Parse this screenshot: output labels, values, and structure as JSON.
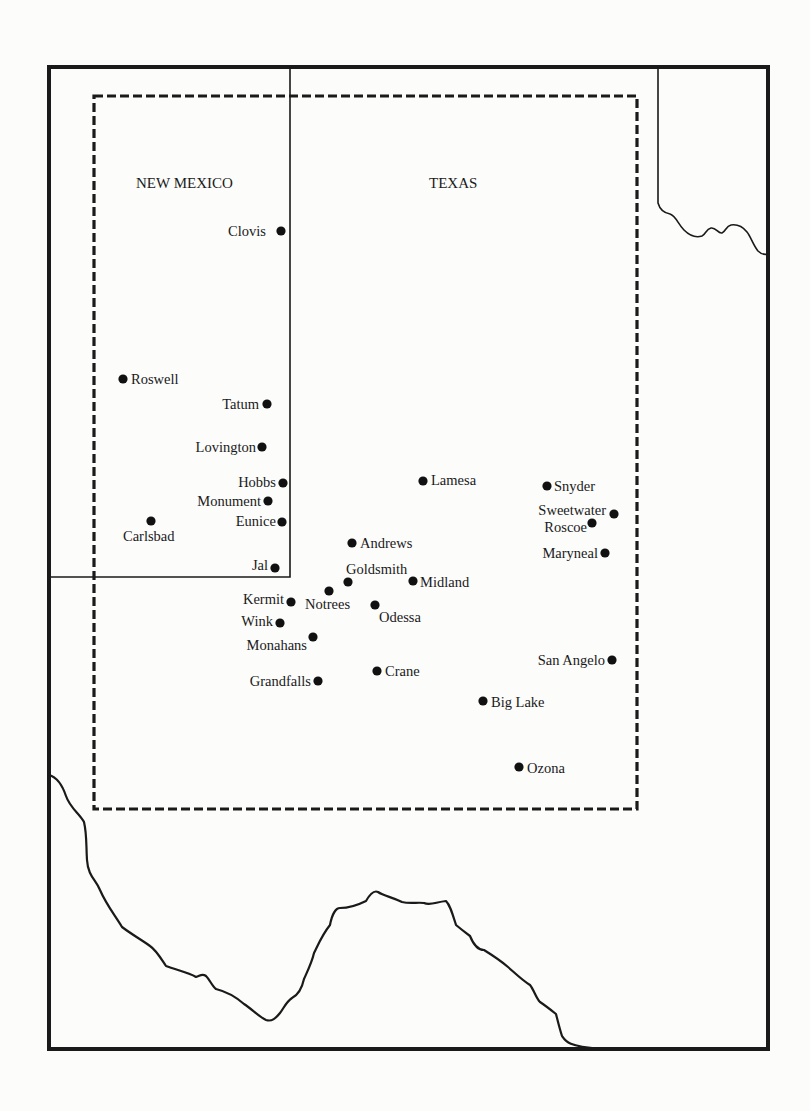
{
  "map": {
    "state_labels": [
      {
        "name": "new-mexico",
        "text": "NEW MEXICO",
        "x": 136,
        "y": 188
      },
      {
        "name": "texas",
        "text": "TEXAS",
        "x": 429,
        "y": 188
      }
    ],
    "cities": [
      {
        "name": "Clovis",
        "dot": [
          281,
          231
        ],
        "label": [
          228,
          236
        ],
        "anchor": "start"
      },
      {
        "name": "Roswell",
        "dot": [
          123,
          379
        ],
        "label": [
          131,
          384
        ],
        "anchor": "start"
      },
      {
        "name": "Tatum",
        "dot": [
          267,
          404
        ],
        "label": [
          259,
          409
        ],
        "anchor": "end"
      },
      {
        "name": "Lovington",
        "dot": [
          262,
          447
        ],
        "label": [
          256,
          452
        ],
        "anchor": "end"
      },
      {
        "name": "Hobbs",
        "dot": [
          283,
          483
        ],
        "label": [
          276,
          487
        ],
        "anchor": "end"
      },
      {
        "name": "Monument",
        "dot": [
          268,
          501
        ],
        "label": [
          261,
          506
        ],
        "anchor": "end"
      },
      {
        "name": "Eunice",
        "dot": [
          282,
          522
        ],
        "label": [
          276,
          526
        ],
        "anchor": "end"
      },
      {
        "name": "Carlsbad",
        "dot": [
          151,
          521
        ],
        "label": [
          123,
          541
        ],
        "anchor": "start"
      },
      {
        "name": "Jal",
        "dot": [
          275,
          568
        ],
        "label": [
          268,
          570
        ],
        "anchor": "end"
      },
      {
        "name": "Andrews",
        "dot": [
          352,
          543
        ],
        "label": [
          360,
          548
        ],
        "anchor": "start"
      },
      {
        "name": "Goldsmith",
        "dot": [
          348,
          582
        ],
        "label": [
          346,
          574
        ],
        "anchor": "start"
      },
      {
        "name": "Notrees",
        "dot": [
          329,
          591
        ],
        "label": [
          305,
          609
        ],
        "anchor": "start"
      },
      {
        "name": "Midland",
        "dot": [
          413,
          581
        ],
        "label": [
          420,
          587
        ],
        "anchor": "start"
      },
      {
        "name": "Kermit",
        "dot": [
          291,
          602
        ],
        "label": [
          284,
          604
        ],
        "anchor": "end"
      },
      {
        "name": "Odessa",
        "dot": [
          375,
          605
        ],
        "label": [
          379,
          622
        ],
        "anchor": "start"
      },
      {
        "name": "Wink",
        "dot": [
          280,
          623
        ],
        "label": [
          273,
          626
        ],
        "anchor": "end"
      },
      {
        "name": "Monahans",
        "dot": [
          313,
          637
        ],
        "label": [
          307,
          650
        ],
        "anchor": "end"
      },
      {
        "name": "Grandfalls",
        "dot": [
          318,
          681
        ],
        "label": [
          311,
          686
        ],
        "anchor": "end"
      },
      {
        "name": "Crane",
        "dot": [
          377,
          671
        ],
        "label": [
          385,
          676
        ],
        "anchor": "start"
      },
      {
        "name": "Lamesa",
        "dot": [
          423,
          481
        ],
        "label": [
          431,
          485
        ],
        "anchor": "start"
      },
      {
        "name": "Snyder",
        "dot": [
          547,
          486
        ],
        "label": [
          554,
          491
        ],
        "anchor": "start"
      },
      {
        "name": "Sweetwater",
        "dot": [
          614,
          514
        ],
        "label": [
          606,
          515
        ],
        "anchor": "end"
      },
      {
        "name": "Roscoe",
        "dot": [
          592,
          523
        ],
        "label": [
          587,
          532
        ],
        "anchor": "end"
      },
      {
        "name": "Maryneal",
        "dot": [
          605,
          553
        ],
        "label": [
          598,
          558
        ],
        "anchor": "end"
      },
      {
        "name": "San Angelo",
        "dot": [
          612,
          660
        ],
        "label": [
          605,
          665
        ],
        "anchor": "end"
      },
      {
        "name": "Big Lake",
        "dot": [
          483,
          701
        ],
        "label": [
          491,
          707
        ],
        "anchor": "start"
      },
      {
        "name": "Ozona",
        "dot": [
          519,
          767
        ],
        "label": [
          527,
          773
        ],
        "anchor": "start"
      }
    ]
  }
}
